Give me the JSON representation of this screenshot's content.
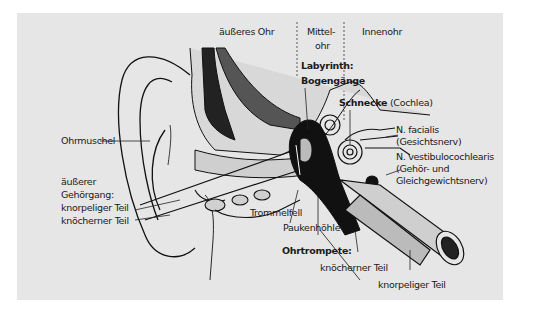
{
  "diagram": {
    "title_regions": {
      "outer_ear": "äußeres Ohr",
      "middle_ear_line1": "Mittel-",
      "middle_ear_line2": "ohr",
      "inner_ear": "Innenohr"
    },
    "labels": {
      "labyrinth": "Labyrinth:",
      "semicircular_canals": "Bogengänge",
      "cochlea_bold": "Schnecke",
      "cochlea_latin": " (Cochlea)",
      "facial_nerve_1": "N. facialis",
      "facial_nerve_2": "(Gesichtsnerv)",
      "vestibulo_1": "N. vestibulocochlearis",
      "vestibulo_2": "(Gehör- und",
      "vestibulo_3": "Gleichgewichtsnerv)",
      "auricle": "Ohrmuschel",
      "canal_1": "äußerer",
      "canal_2": "Gehörgang:",
      "canal_3": "knorpeliger Teil",
      "canal_4": "knöcherner Teil",
      "eardrum": "Trommelfell",
      "tympanic_cavity": "Paukenhöhle",
      "eustachian": "Ohrtrompete:",
      "eustachian_bony": "knöcherner Teil",
      "eustachian_cartilage": "knorpeliger Teil"
    },
    "colors": {
      "background": "#e6e6e6",
      "ink": "#1a1a1a"
    }
  }
}
